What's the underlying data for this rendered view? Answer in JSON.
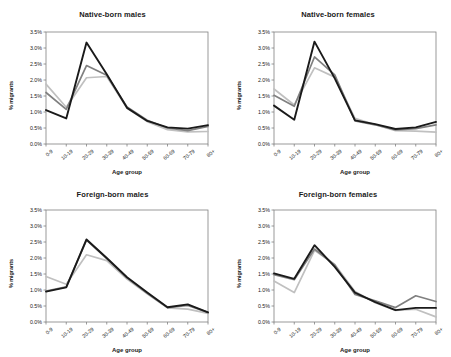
{
  "figure": {
    "axis_label_x": "Age group",
    "axis_label_y": "% migrants",
    "ytick_labels": [
      "3.5%",
      "3.0%",
      "2.5%",
      "2.0%",
      "1.5%",
      "1.0%",
      "0.5%",
      "0.0%"
    ],
    "xtick_labels": [
      "0-9",
      "10-19",
      "20-29",
      "30-39",
      "40-49",
      "50-59",
      "60-69",
      "70-79",
      "80+"
    ],
    "colors": {
      "series_dark": "#1a1a1a",
      "series_mid": "#808080",
      "series_light": "#c0c0c0",
      "axis": "#808080",
      "text": "#1a1a1a",
      "background": "#ffffff"
    },
    "panel_titles": [
      "Native-born males",
      "Native-born females",
      "Foreign-born males",
      "Foreign-born females"
    ]
  },
  "chart_data": [
    {
      "type": "line",
      "title": "Native-born males",
      "xlabel": "Age group",
      "ylabel": "% migrants",
      "categories": [
        "0-9",
        "10-19",
        "20-29",
        "30-39",
        "40-49",
        "50-59",
        "60-69",
        "70-79",
        "80+"
      ],
      "ylim": [
        0,
        3.5
      ],
      "yticks": [
        0,
        0.5,
        1.0,
        1.5,
        2.0,
        2.5,
        3.0,
        3.5
      ],
      "grid": false,
      "legend": "none",
      "series": [
        {
          "name": "dark",
          "color": "#1a1a1a",
          "values": [
            1.06,
            0.8,
            3.17,
            2.18,
            1.13,
            0.72,
            0.52,
            0.48,
            0.59
          ]
        },
        {
          "name": "mid",
          "color": "#808080",
          "values": [
            1.61,
            1.08,
            2.45,
            2.15,
            1.16,
            0.74,
            0.5,
            0.42,
            0.55
          ]
        },
        {
          "name": "light",
          "color": "#c0c0c0",
          "values": [
            1.87,
            1.15,
            2.07,
            2.11,
            1.12,
            0.7,
            0.45,
            0.38,
            0.39
          ]
        }
      ]
    },
    {
      "type": "line",
      "title": "Native-born females",
      "xlabel": "Age group",
      "ylabel": "% migrants",
      "categories": [
        "0-9",
        "10-19",
        "20-29",
        "30-39",
        "40-49",
        "50-59",
        "60-69",
        "70-79",
        "80+"
      ],
      "ylim": [
        0,
        3.5
      ],
      "yticks": [
        0,
        0.5,
        1.0,
        1.5,
        2.0,
        2.5,
        3.0,
        3.5
      ],
      "grid": false,
      "legend": "none",
      "series": [
        {
          "name": "dark",
          "color": "#1a1a1a",
          "values": [
            1.2,
            0.76,
            3.2,
            2.05,
            0.74,
            0.62,
            0.47,
            0.52,
            0.69
          ]
        },
        {
          "name": "mid",
          "color": "#808080",
          "values": [
            1.52,
            1.18,
            2.72,
            2.16,
            0.72,
            0.6,
            0.44,
            0.48,
            0.6
          ]
        },
        {
          "name": "light",
          "color": "#c0c0c0",
          "values": [
            1.72,
            1.22,
            2.38,
            2.09,
            0.8,
            0.6,
            0.42,
            0.4,
            0.37
          ]
        }
      ]
    },
    {
      "type": "line",
      "title": "Foreign-born males",
      "xlabel": "Age group",
      "ylabel": "% migrants",
      "categories": [
        "0-9",
        "10-19",
        "20-29",
        "30-39",
        "40-49",
        "50-59",
        "60-69",
        "70-79",
        "80+"
      ],
      "ylim": [
        0,
        3.5
      ],
      "yticks": [
        0,
        0.5,
        1.0,
        1.5,
        2.0,
        2.5,
        3.0,
        3.5
      ],
      "grid": false,
      "legend": "none",
      "series": [
        {
          "name": "dark",
          "color": "#1a1a1a",
          "values": [
            0.95,
            1.08,
            2.58,
            2.0,
            1.4,
            0.92,
            0.46,
            0.55,
            0.3
          ]
        },
        {
          "name": "mid",
          "color": "#808080",
          "values": [
            0.97,
            1.1,
            2.56,
            1.98,
            1.38,
            0.9,
            0.45,
            0.52,
            0.3
          ]
        },
        {
          "name": "light",
          "color": "#c0c0c0",
          "values": [
            1.42,
            1.18,
            2.1,
            1.92,
            1.34,
            0.88,
            0.44,
            0.4,
            0.27
          ]
        }
      ]
    },
    {
      "type": "line",
      "title": "Foreign-born females",
      "xlabel": "Age group",
      "ylabel": "% migrants",
      "categories": [
        "0-9",
        "10-19",
        "20-29",
        "30-39",
        "40-49",
        "50-59",
        "60-69",
        "70-79",
        "80+"
      ],
      "ylim": [
        0,
        3.5
      ],
      "yticks": [
        0,
        0.5,
        1.0,
        1.5,
        2.0,
        2.5,
        3.0,
        3.5
      ],
      "grid": false,
      "legend": "none",
      "series": [
        {
          "name": "dark",
          "color": "#1a1a1a",
          "values": [
            1.52,
            1.35,
            2.4,
            1.72,
            0.92,
            0.62,
            0.37,
            0.44,
            0.44
          ]
        },
        {
          "name": "mid",
          "color": "#808080",
          "values": [
            1.48,
            1.32,
            2.28,
            1.78,
            0.86,
            0.66,
            0.45,
            0.82,
            0.64
          ]
        },
        {
          "name": "light",
          "color": "#c0c0c0",
          "values": [
            1.28,
            0.92,
            2.24,
            1.8,
            0.95,
            0.6,
            0.36,
            0.4,
            0.16
          ]
        }
      ]
    }
  ]
}
